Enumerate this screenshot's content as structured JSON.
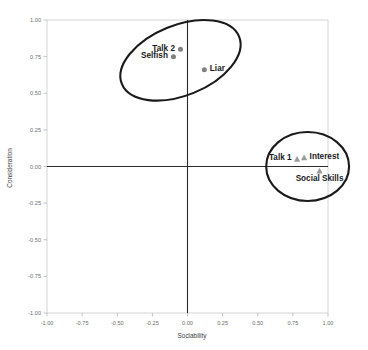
{
  "chart_data": {
    "type": "scatter",
    "title": "",
    "xlabel": "Sociability",
    "ylabel": "Consideration",
    "xlim": [
      -1.0,
      1.0
    ],
    "ylim": [
      -1.0,
      1.0
    ],
    "grid": false,
    "legend": "none",
    "xticks": [
      "-1.00",
      "-0.75",
      "-0.50",
      "-0.25",
      "0.00",
      "0.25",
      "0.50",
      "0.75",
      "1.00"
    ],
    "xtick_values": [
      -1.0,
      -0.75,
      -0.5,
      -0.25,
      0.0,
      0.25,
      0.5,
      0.75,
      1.0
    ],
    "yticks": [
      "-1.00",
      "-0.75",
      "-0.50",
      "-0.25",
      "0.00",
      "0.25",
      "0.50",
      "0.75",
      "1.00"
    ],
    "ytick_values": [
      -1.0,
      -0.75,
      -0.5,
      -0.25,
      0.0,
      0.25,
      0.5,
      0.75,
      1.0
    ],
    "series": [
      {
        "name": "Upper cluster",
        "marker": "circle",
        "color": "#808080",
        "points": [
          {
            "label": "Talk 2",
            "x": -0.05,
            "y": 0.8,
            "label_pos": "left"
          },
          {
            "label": "Selfish",
            "x": -0.1,
            "y": 0.75,
            "label_pos": "left"
          },
          {
            "label": "Liar",
            "x": 0.12,
            "y": 0.66,
            "label_pos": "right"
          }
        ]
      },
      {
        "name": "Right cluster",
        "marker": "triangle",
        "color": "#9a9a9a",
        "points": [
          {
            "label": "Talk 1",
            "x": 0.78,
            "y": 0.05,
            "label_pos": "left"
          },
          {
            "label": "Interest",
            "x": 0.83,
            "y": 0.06,
            "label_pos": "right"
          },
          {
            "label": "Social Skills",
            "x": 0.94,
            "y": -0.03,
            "label_pos": "below"
          }
        ]
      }
    ],
    "annotations": [
      {
        "name": "upper-cluster-ellipse",
        "shape": "ellipse",
        "cx": -0.05,
        "cy": 0.725,
        "rx": 0.45,
        "ry": 0.24,
        "rotation": -22
      },
      {
        "name": "right-cluster-ellipse",
        "shape": "ellipse",
        "cx": 0.855,
        "cy": 0.0,
        "rx": 0.295,
        "ry": 0.235,
        "rotation": 0
      }
    ],
    "reference_lines": [
      {
        "name": "vertical-zero-line",
        "orientation": "vertical",
        "value": 0.0
      },
      {
        "name": "horizontal-zero-line",
        "orientation": "horizontal",
        "value": 0.0
      }
    ]
  }
}
